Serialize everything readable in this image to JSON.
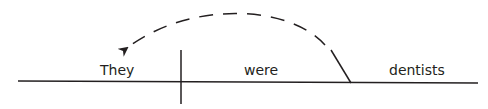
{
  "diagram": {
    "type": "sentence-diagram",
    "words": {
      "subject": "They",
      "verb": "were",
      "complement": "dentists"
    },
    "arrow": {
      "style": "dashed",
      "from": "complement",
      "to": "subject"
    },
    "colors": {
      "line": "#231f20",
      "background": "#ffffff"
    }
  }
}
